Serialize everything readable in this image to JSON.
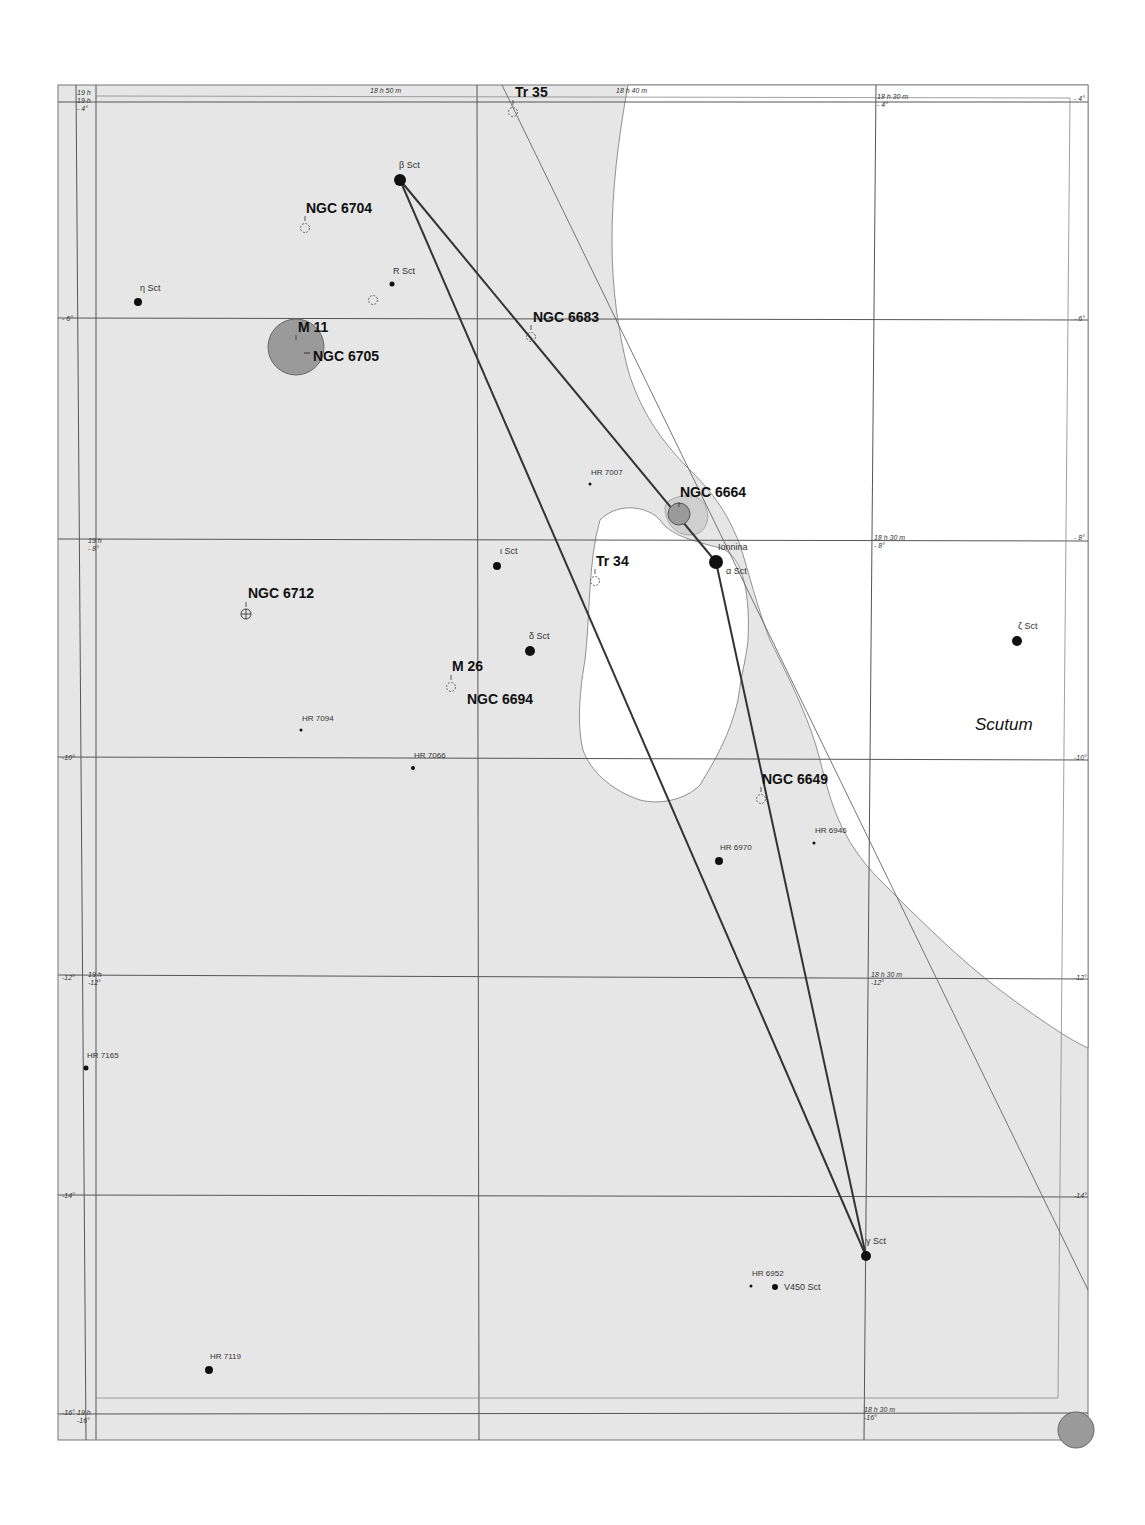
{
  "chart_title": "Scutum star-hop chart",
  "colors": {
    "milky_way": "#e6e6e6",
    "background": "#ffffff",
    "grid": "#555555",
    "asterism_line": "#333333",
    "star": "#111111",
    "cluster_fill": "#9a9a9a"
  },
  "constellation": {
    "label": "Scutum",
    "x": 975,
    "y": 730
  },
  "ra_labels": [
    {
      "text": "19 h",
      "x": 77,
      "y": 95
    },
    {
      "text": "19 h",
      "x": 77,
      "y": 103
    },
    {
      "text": "18 h 50 m",
      "x": 370,
      "y": 93
    },
    {
      "text": "18 h 40 m",
      "x": 616,
      "y": 93
    },
    {
      "text": "18 h 30 m",
      "x": 877,
      "y": 99
    },
    {
      "text": "19 h",
      "x": 88,
      "y": 543
    },
    {
      "text": "18 h 30 m",
      "x": 874,
      "y": 540
    },
    {
      "text": "19 h",
      "x": 88,
      "y": 977
    },
    {
      "text": "18 h 30 m",
      "x": 871,
      "y": 977
    },
    {
      "text": "19 h",
      "x": 77,
      "y": 1415
    },
    {
      "text": "18 h 30 m",
      "x": 864,
      "y": 1412
    }
  ],
  "dec_labels": [
    {
      "text": "- 4°",
      "x": 77,
      "y": 111
    },
    {
      "text": "- 4°",
      "x": 877,
      "y": 107
    },
    {
      "text": "- 4°",
      "x": 1074,
      "y": 101
    },
    {
      "text": "- 6°",
      "x": 62,
      "y": 321
    },
    {
      "text": "- 6°",
      "x": 1074,
      "y": 321
    },
    {
      "text": "- 8°",
      "x": 88,
      "y": 551
    },
    {
      "text": "- 8°",
      "x": 874,
      "y": 548
    },
    {
      "text": "- 8°",
      "x": 1074,
      "y": 540
    },
    {
      "text": "-10°",
      "x": 62,
      "y": 760
    },
    {
      "text": "-10°",
      "x": 1074,
      "y": 760
    },
    {
      "text": "-12°",
      "x": 62,
      "y": 980
    },
    {
      "text": "-12°",
      "x": 88,
      "y": 985
    },
    {
      "text": "-12°",
      "x": 871,
      "y": 985
    },
    {
      "text": "-12°",
      "x": 1074,
      "y": 980
    },
    {
      "text": "-14°",
      "x": 62,
      "y": 1198
    },
    {
      "text": "-14°",
      "x": 1074,
      "y": 1198
    },
    {
      "text": "-16°",
      "x": 62,
      "y": 1415
    },
    {
      "text": "-16°",
      "x": 77,
      "y": 1423
    },
    {
      "text": "-16°",
      "x": 864,
      "y": 1420
    }
  ],
  "deep_sky_objects": [
    {
      "name": "Tr 35",
      "x": 513,
      "y": 112,
      "label_x": 515,
      "label_y": 97,
      "symbol": "open-cluster"
    },
    {
      "name": "NGC 6704",
      "x": 305,
      "y": 228,
      "label_x": 306,
      "label_y": 213,
      "symbol": "open-cluster"
    },
    {
      "name": "M 11",
      "x": 296,
      "y": 347,
      "label_x": 298,
      "label_y": 332,
      "symbol": "large-cluster"
    },
    {
      "name": "NGC 6705",
      "x": 296,
      "y": 347,
      "label_x": 313,
      "label_y": 361,
      "symbol": "none"
    },
    {
      "name": "NGC 6683",
      "x": 531,
      "y": 337,
      "label_x": 533,
      "label_y": 322,
      "symbol": "open-cluster"
    },
    {
      "name": "NGC 6664",
      "x": 679,
      "y": 514,
      "label_x": 680,
      "label_y": 497,
      "symbol": "filled-cluster"
    },
    {
      "name": "Tr 34",
      "x": 595,
      "y": 581,
      "label_x": 596,
      "label_y": 566,
      "symbol": "open-cluster"
    },
    {
      "name": "NGC 6712",
      "x": 246,
      "y": 614,
      "label_x": 248,
      "label_y": 598,
      "symbol": "globular"
    },
    {
      "name": "M 26",
      "x": 451,
      "y": 687,
      "label_x": 452,
      "label_y": 671,
      "symbol": "open-cluster"
    },
    {
      "name": "NGC 6694",
      "x": 451,
      "y": 687,
      "label_x": 467,
      "label_y": 704,
      "symbol": "none"
    },
    {
      "name": "NGC 6649",
      "x": 761,
      "y": 799,
      "label_x": 762,
      "label_y": 784,
      "symbol": "open-cluster"
    },
    {
      "name": "",
      "x": 373,
      "y": 300,
      "label_x": 0,
      "label_y": 0,
      "symbol": "open-cluster"
    }
  ],
  "stars": [
    {
      "name": "β Sct",
      "x": 400,
      "y": 180,
      "r": 6,
      "label_x": 399,
      "label_y": 168
    },
    {
      "name": "η Sct",
      "x": 138,
      "y": 302,
      "r": 4,
      "label_x": 140,
      "label_y": 291
    },
    {
      "name": "R Sct",
      "x": 392,
      "y": 284,
      "r": 2.5,
      "label_x": 393,
      "label_y": 274
    },
    {
      "name": "HR 7007",
      "x": 590,
      "y": 484,
      "r": 1.5,
      "label_x": 591,
      "label_y": 475
    },
    {
      "name": "Ionnina",
      "x": 716,
      "y": 562,
      "r": 7,
      "label_x": 718,
      "label_y": 550
    },
    {
      "name": "α Sct",
      "x": 716,
      "y": 562,
      "r": 0,
      "label_x": 726,
      "label_y": 574
    },
    {
      "name": "ι Sct",
      "x": 497,
      "y": 566,
      "r": 4,
      "label_x": 500,
      "label_y": 554
    },
    {
      "name": "δ Sct",
      "x": 530,
      "y": 651,
      "r": 5,
      "label_x": 529,
      "label_y": 639
    },
    {
      "name": "ζ Sct",
      "x": 1017,
      "y": 641,
      "r": 5,
      "label_x": 1018,
      "label_y": 629
    },
    {
      "name": "HR 7094",
      "x": 301,
      "y": 730,
      "r": 1.5,
      "label_x": 302,
      "label_y": 721
    },
    {
      "name": "HR 7066",
      "x": 413,
      "y": 768,
      "r": 2,
      "label_x": 414,
      "label_y": 758
    },
    {
      "name": "HR 6946",
      "x": 814,
      "y": 843,
      "r": 1.5,
      "label_x": 815,
      "label_y": 833
    },
    {
      "name": "HR 6970",
      "x": 719,
      "y": 861,
      "r": 4,
      "label_x": 720,
      "label_y": 850
    },
    {
      "name": "HR 7165",
      "x": 86,
      "y": 1068,
      "r": 2.5,
      "label_x": 87,
      "label_y": 1058
    },
    {
      "name": "γ Sct",
      "x": 866,
      "y": 1256,
      "r": 5,
      "label_x": 866,
      "label_y": 1244
    },
    {
      "name": "HR 6952",
      "x": 751,
      "y": 1286,
      "r": 1.5,
      "label_x": 752,
      "label_y": 1276
    },
    {
      "name": "V450 Sct",
      "x": 775,
      "y": 1287,
      "r": 3,
      "label_x": 784,
      "label_y": 1290
    },
    {
      "name": "HR 7119",
      "x": 209,
      "y": 1370,
      "r": 4,
      "label_x": 210,
      "label_y": 1359
    }
  ],
  "asterism_lines": [
    {
      "from": "β Sct",
      "x1": 400,
      "y1": 180,
      "x2": 716,
      "y2": 562
    },
    {
      "from": "β Sct",
      "x1": 400,
      "y1": 180,
      "x2": 866,
      "y2": 1256
    },
    {
      "from": "Ionnina",
      "x1": 716,
      "y1": 562,
      "x2": 866,
      "y2": 1256
    }
  ]
}
